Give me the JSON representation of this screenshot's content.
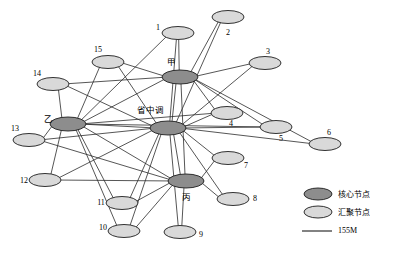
{
  "figure": {
    "title": "",
    "caption_partial": "",
    "background": "#ffffff"
  },
  "colors": {
    "core_node_fill": "#8d8d8d",
    "aggregation_node_fill": "#d9d9d9",
    "node_stroke": "#1c1c1c",
    "edge_stroke": "#2b2b2b"
  },
  "legend": {
    "items": [
      {
        "label": "核心节点",
        "type": "core-node-swatch",
        "fill": "#8d8d8d"
      },
      {
        "label": "汇聚节点",
        "type": "aggregation-node-swatch",
        "fill": "#d9d9d9"
      },
      {
        "label": "155M",
        "type": "link-line-swatch",
        "stroke": "#1c1c1c"
      }
    ]
  },
  "graph": {
    "type": "network-topology",
    "node_count": 19,
    "core_nodes": [
      "省中调",
      "甲",
      "乙",
      "丙"
    ],
    "nodes": [
      {
        "id": "hub",
        "label": "省中调",
        "kind": "core",
        "cx": 168,
        "cy": 128,
        "rx": 18,
        "ry": 7,
        "label_x": 150,
        "label_y": 110,
        "label_anchor": "middle",
        "script": "cn"
      },
      {
        "id": "jia",
        "label": "甲",
        "kind": "core",
        "cx": 180,
        "cy": 77,
        "rx": 18,
        "ry": 7,
        "label_x": 171,
        "label_y": 62,
        "label_anchor": "middle",
        "script": "cn"
      },
      {
        "id": "yi",
        "label": "乙",
        "kind": "core",
        "cx": 68,
        "cy": 124,
        "rx": 18,
        "ry": 7,
        "label_x": 48,
        "label_y": 119,
        "label_anchor": "middle",
        "script": "cn"
      },
      {
        "id": "bing",
        "label": "丙",
        "kind": "core",
        "cx": 186,
        "cy": 181,
        "rx": 18,
        "ry": 7,
        "label_x": 186,
        "label_y": 197,
        "label_anchor": "middle",
        "script": "cn"
      },
      {
        "id": "n1",
        "label": "1",
        "kind": "aggregation",
        "cx": 178,
        "cy": 33,
        "rx": 16,
        "ry": 6.5,
        "label_x": 158,
        "label_y": 28,
        "label_anchor": "middle",
        "script": "latin"
      },
      {
        "id": "n2",
        "label": "2",
        "kind": "aggregation",
        "cx": 228,
        "cy": 17,
        "rx": 16,
        "ry": 6.5,
        "label_x": 228,
        "label_y": 33,
        "label_anchor": "middle",
        "script": "latin"
      },
      {
        "id": "n3",
        "label": "3",
        "kind": "aggregation",
        "cx": 265,
        "cy": 63,
        "rx": 16,
        "ry": 6.5,
        "label_x": 268,
        "label_y": 52,
        "label_anchor": "middle",
        "script": "latin"
      },
      {
        "id": "n4",
        "label": "4",
        "kind": "aggregation",
        "cx": 227,
        "cy": 113,
        "rx": 16,
        "ry": 6.5,
        "label_x": 231,
        "label_y": 124,
        "label_anchor": "middle",
        "script": "latin"
      },
      {
        "id": "n5",
        "label": "5",
        "kind": "aggregation",
        "cx": 276,
        "cy": 127,
        "rx": 16,
        "ry": 6.5,
        "label_x": 281,
        "label_y": 139,
        "label_anchor": "middle",
        "script": "latin"
      },
      {
        "id": "n6",
        "label": "6",
        "kind": "aggregation",
        "cx": 325,
        "cy": 144,
        "rx": 16,
        "ry": 6.5,
        "label_x": 329,
        "label_y": 133,
        "label_anchor": "middle",
        "script": "latin"
      },
      {
        "id": "n7",
        "label": "7",
        "kind": "aggregation",
        "cx": 228,
        "cy": 158,
        "rx": 16,
        "ry": 6.5,
        "label_x": 246,
        "label_y": 166,
        "label_anchor": "middle",
        "script": "latin"
      },
      {
        "id": "n8",
        "label": "8",
        "kind": "aggregation",
        "cx": 233,
        "cy": 199,
        "rx": 16,
        "ry": 6.5,
        "label_x": 255,
        "label_y": 199,
        "label_anchor": "middle",
        "script": "latin"
      },
      {
        "id": "n9",
        "label": "9",
        "kind": "aggregation",
        "cx": 180,
        "cy": 232,
        "rx": 16,
        "ry": 6.5,
        "label_x": 201,
        "label_y": 235,
        "label_anchor": "middle",
        "script": "latin"
      },
      {
        "id": "n10",
        "label": "10",
        "kind": "aggregation",
        "cx": 124,
        "cy": 231,
        "rx": 16,
        "ry": 6.5,
        "label_x": 103,
        "label_y": 228,
        "label_anchor": "middle",
        "script": "latin"
      },
      {
        "id": "n11",
        "label": "11",
        "kind": "aggregation",
        "cx": 122,
        "cy": 203,
        "rx": 16,
        "ry": 6.5,
        "label_x": 101,
        "label_y": 203,
        "label_anchor": "middle",
        "script": "latin"
      },
      {
        "id": "n12",
        "label": "12",
        "kind": "aggregation",
        "cx": 45,
        "cy": 180,
        "rx": 16,
        "ry": 6.5,
        "label_x": 24,
        "label_y": 181,
        "label_anchor": "middle",
        "script": "latin"
      },
      {
        "id": "n13",
        "label": "13",
        "kind": "aggregation",
        "cx": 29,
        "cy": 140,
        "rx": 16,
        "ry": 6.5,
        "label_x": 15,
        "label_y": 129,
        "label_anchor": "middle",
        "script": "latin"
      },
      {
        "id": "n14",
        "label": "14",
        "kind": "aggregation",
        "cx": 53,
        "cy": 84,
        "rx": 16,
        "ry": 6.5,
        "label_x": 37,
        "label_y": 74,
        "label_anchor": "middle",
        "script": "latin"
      },
      {
        "id": "n15",
        "label": "15",
        "kind": "aggregation",
        "cx": 108,
        "cy": 62,
        "rx": 16,
        "ry": 6.5,
        "label_x": 98,
        "label_y": 50,
        "label_anchor": "middle",
        "script": "latin"
      }
    ],
    "edges": [
      {
        "from": "hub",
        "to": "jia"
      },
      {
        "from": "hub",
        "to": "yi"
      },
      {
        "from": "hub",
        "to": "bing"
      },
      {
        "from": "jia",
        "to": "yi"
      },
      {
        "from": "jia",
        "to": "bing"
      },
      {
        "from": "yi",
        "to": "bing"
      },
      {
        "from": "jia",
        "to": "n1"
      },
      {
        "from": "jia",
        "to": "n2"
      },
      {
        "from": "jia",
        "to": "n3"
      },
      {
        "from": "jia",
        "to": "n4"
      },
      {
        "from": "jia",
        "to": "n5"
      },
      {
        "from": "jia",
        "to": "n6"
      },
      {
        "from": "jia",
        "to": "n15"
      },
      {
        "from": "jia",
        "to": "n14"
      },
      {
        "from": "hub",
        "to": "n1"
      },
      {
        "from": "hub",
        "to": "n2"
      },
      {
        "from": "hub",
        "to": "n3"
      },
      {
        "from": "hub",
        "to": "n4"
      },
      {
        "from": "hub",
        "to": "n5"
      },
      {
        "from": "hub",
        "to": "n6"
      },
      {
        "from": "hub",
        "to": "n7"
      },
      {
        "from": "hub",
        "to": "n8"
      },
      {
        "from": "hub",
        "to": "n9"
      },
      {
        "from": "hub",
        "to": "n10"
      },
      {
        "from": "hub",
        "to": "n11"
      },
      {
        "from": "hub",
        "to": "n12"
      },
      {
        "from": "hub",
        "to": "n13"
      },
      {
        "from": "hub",
        "to": "n14"
      },
      {
        "from": "hub",
        "to": "n15"
      },
      {
        "from": "yi",
        "to": "n1"
      },
      {
        "from": "yi",
        "to": "n4"
      },
      {
        "from": "yi",
        "to": "n5"
      },
      {
        "from": "yi",
        "to": "n10"
      },
      {
        "from": "yi",
        "to": "n11"
      },
      {
        "from": "yi",
        "to": "n12"
      },
      {
        "from": "yi",
        "to": "n13"
      },
      {
        "from": "yi",
        "to": "n14"
      },
      {
        "from": "yi",
        "to": "n15"
      },
      {
        "from": "bing",
        "to": "n7"
      },
      {
        "from": "bing",
        "to": "n8"
      },
      {
        "from": "bing",
        "to": "n9"
      },
      {
        "from": "bing",
        "to": "n10"
      },
      {
        "from": "bing",
        "to": "n11"
      },
      {
        "from": "bing",
        "to": "n12"
      },
      {
        "from": "bing",
        "to": "n13"
      }
    ]
  },
  "legend_layout": {
    "swatch_cx": 318,
    "swatch_rx": 14,
    "swatch_ry": 6,
    "row_y": [
      194,
      212
    ],
    "line_y": 231,
    "line_x1": 302,
    "line_x2": 332,
    "text_x": 338
  }
}
